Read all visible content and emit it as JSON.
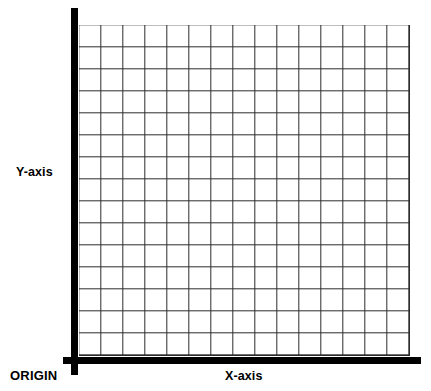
{
  "figure": {
    "name": "cartesian-coordinate-grid",
    "background_color": "#ffffff"
  },
  "labels": {
    "y_axis": "Y-axis",
    "x_axis": "X-axis",
    "origin": "ORIGIN"
  },
  "chart_data": {
    "type": "grid",
    "title": "",
    "xlabel": "X-axis",
    "ylabel": "Y-axis",
    "origin_label": "ORIGIN",
    "grid": true,
    "grid_columns": 15,
    "grid_rows": 15,
    "cell_size_px": 22,
    "xlim": [
      0,
      15
    ],
    "ylim": [
      0,
      15
    ],
    "x_tick_labels": [],
    "y_tick_labels": [],
    "series": [],
    "legend": null,
    "axis_color": "#000000",
    "grid_color": "#2b2b2b"
  }
}
